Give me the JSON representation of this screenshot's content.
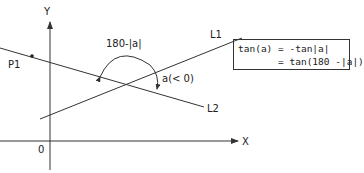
{
  "diagram": {
    "axes": {
      "x_label": "X",
      "y_label": "Y",
      "origin_label": "0"
    },
    "lines": [
      {
        "name": "L1",
        "label": "L1"
      },
      {
        "name": "L2",
        "label": "L2"
      }
    ],
    "point": {
      "label": "P1"
    },
    "angles": {
      "supplement_label": "180-|a|",
      "angle_label": "a(< 0)"
    },
    "formula": {
      "line1": "tan(a) = -tan|a|",
      "line2": "       = tan(180 -|a|)"
    },
    "colors": {
      "stroke": "#333333",
      "text": "#222222",
      "background": "#ffffff"
    }
  }
}
